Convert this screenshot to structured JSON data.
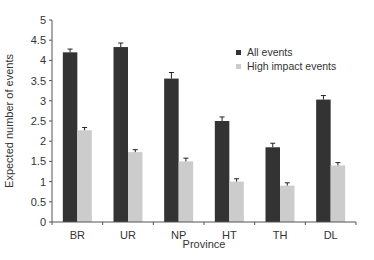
{
  "chart_data": {
    "type": "bar",
    "title": "",
    "xlabel": "Province",
    "ylabel": "Expected number of events",
    "categories": [
      "BR",
      "UR",
      "NP",
      "HT",
      "TH",
      "DL"
    ],
    "series": [
      {
        "name": "All events",
        "color": "#333333",
        "values": [
          4.2,
          4.33,
          3.55,
          2.5,
          1.85,
          3.03
        ],
        "errors": [
          0.08,
          0.1,
          0.15,
          0.1,
          0.1,
          0.1
        ]
      },
      {
        "name": "High impact events",
        "color": "#cccccc",
        "values": [
          2.27,
          1.73,
          1.5,
          1.0,
          0.9,
          1.4
        ],
        "errors": [
          0.07,
          0.06,
          0.08,
          0.07,
          0.07,
          0.07
        ]
      }
    ],
    "ylim": [
      0,
      5
    ],
    "yticks": [
      "0",
      "0.5",
      "1",
      "1.5",
      "2",
      "2.5",
      "3",
      "3.5",
      "4",
      "4.5",
      "5"
    ],
    "grid": false,
    "legend_position": "upper right"
  }
}
